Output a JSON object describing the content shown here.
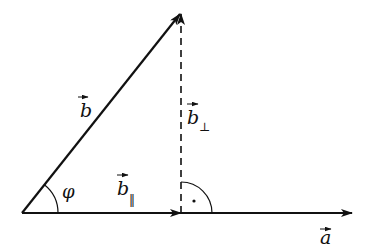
{
  "diagram": {
    "colors": {
      "stroke": "#111111",
      "background": "#ffffff"
    },
    "points": {
      "origin": [
        22,
        213
      ],
      "apex": [
        180,
        13
      ],
      "foot": [
        181,
        213
      ],
      "a_end": [
        352,
        213
      ]
    },
    "labels": {
      "b": "b",
      "b_perp": "b",
      "b_perp_sub": "⊥",
      "b_par": "b",
      "b_par_sub": "‖",
      "a": "a",
      "angle": "φ",
      "right_angle_dot": "·"
    },
    "elements": [
      {
        "name": "vector-a",
        "from": "origin",
        "to": "a_end",
        "style": "solid",
        "label": "a"
      },
      {
        "name": "vector-b",
        "from": "origin",
        "to": "apex",
        "style": "solid",
        "label": "b"
      },
      {
        "name": "vector-b-parallel",
        "from": "origin",
        "to": "foot",
        "style": "solid",
        "label": "b‖"
      },
      {
        "name": "vector-b-perpendicular",
        "from": "foot",
        "to": "apex",
        "style": "dashed",
        "label": "b⊥"
      },
      {
        "name": "angle-arc-phi",
        "center": "origin",
        "radius": 36,
        "label": "φ"
      },
      {
        "name": "right-angle-mark",
        "center": "foot",
        "radius": 31
      }
    ]
  }
}
